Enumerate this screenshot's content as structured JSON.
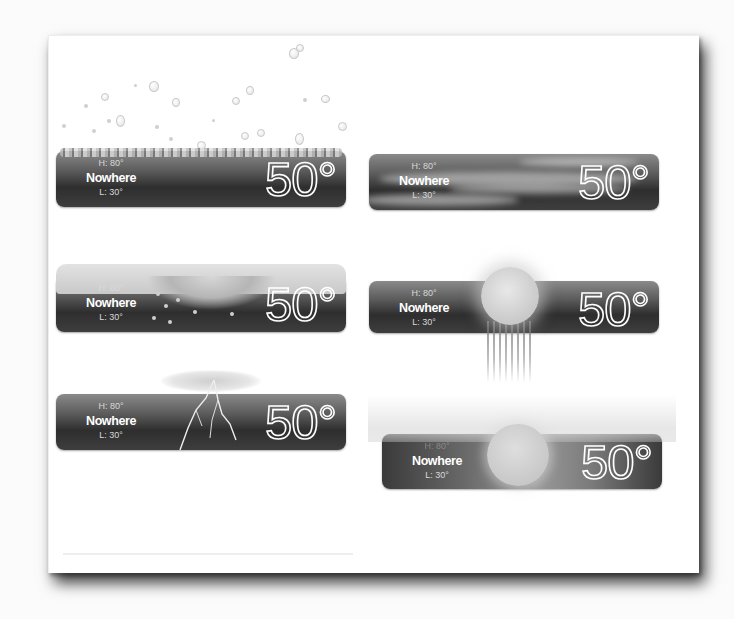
{
  "widgets": [
    {
      "condition": "rain",
      "high": "H: 80°",
      "city": "Nowhere",
      "low": "L: 30°",
      "temperature": "50°"
    },
    {
      "condition": "windy-clouds",
      "high": "H: 80°",
      "city": "Nowhere",
      "low": "L: 30°",
      "temperature": "50°"
    },
    {
      "condition": "snow",
      "high": "H: 80°",
      "city": "Nowhere",
      "low": "L: 30°",
      "temperature": "50°"
    },
    {
      "condition": "sun-shower",
      "high": "H: 80°",
      "city": "Nowhere",
      "low": "L: 30°",
      "temperature": "50°"
    },
    {
      "condition": "thunderstorm",
      "high": "H: 80°",
      "city": "Nowhere",
      "low": "L: 30°",
      "temperature": "50°"
    },
    {
      "condition": "hazy-sun",
      "high": "H: 80°",
      "city": "Nowhere",
      "low": "L: 30°",
      "temperature": "50°"
    }
  ],
  "icons": {
    "rain": "raindrops-icon",
    "windy-clouds": "wind-clouds-icon",
    "snow": "snow-icon",
    "sun-shower": "sun-rain-icon",
    "thunderstorm": "lightning-icon",
    "hazy-sun": "haze-sun-icon"
  },
  "colors": {
    "background": "#fbfbfb",
    "page": "#ffffff",
    "widget_dark": "#2e2e2e",
    "widget_light": "#8a8a8a",
    "text": "#ffffff"
  }
}
